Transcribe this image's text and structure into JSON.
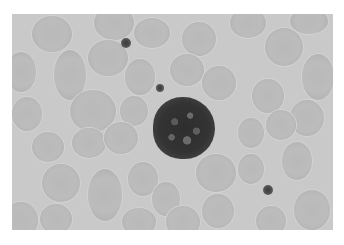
{
  "image": {
    "description": "Grayscale light micrograph of a peripheral blood smear showing a single lymphocyte surrounded by red blood cells, with scattered platelets",
    "colors": {
      "background": "#c9c9c9",
      "rbc": "#b9b9b9",
      "nucleus": "#333333",
      "platelet": "#444444",
      "page": "#ffffff"
    },
    "cells": {
      "lymphocyte": {
        "cx": 184,
        "cy": 128,
        "r": 31
      },
      "platelets": [
        {
          "cx": 126,
          "cy": 43,
          "r": 5
        },
        {
          "cx": 160,
          "cy": 88,
          "r": 4
        },
        {
          "cx": 268,
          "cy": 190,
          "r": 5
        }
      ]
    }
  }
}
